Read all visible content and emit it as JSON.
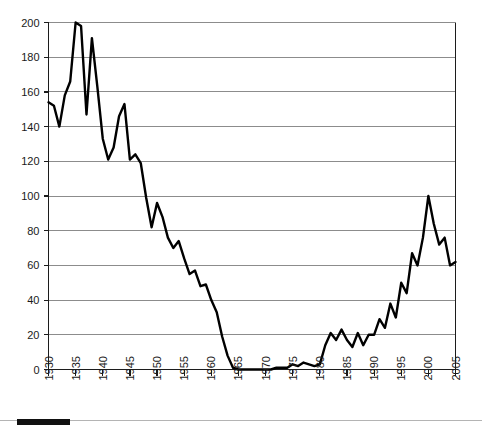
{
  "chart_data": {
    "type": "line",
    "title": "",
    "subtitle": "",
    "xlabel": "",
    "ylabel": "",
    "xlim": [
      1930,
      2005
    ],
    "ylim": [
      0,
      200
    ],
    "grid": true,
    "legend": false,
    "legend_position": "none",
    "line_color": "#000000",
    "grid_color": "#8c8c8c",
    "axis_color": "#1c1c1c",
    "y_ticks": [
      0,
      20,
      40,
      60,
      80,
      100,
      120,
      140,
      160,
      180,
      200
    ],
    "y_tick_labels": [
      "0",
      "20",
      "40",
      "60",
      "80",
      "100",
      "120",
      "140",
      "160",
      "180",
      "200"
    ],
    "x_ticks": [
      1930,
      1935,
      1940,
      1945,
      1950,
      1955,
      1960,
      1965,
      1970,
      1975,
      1980,
      1985,
      1990,
      1995,
      2000,
      2005
    ],
    "x_tick_labels": [
      "1930",
      "1935",
      "1940",
      "1945",
      "1950",
      "1955",
      "1960",
      "1965",
      "1970",
      "1975",
      "1980",
      "1985",
      "1990",
      "1995",
      "2000",
      "2005"
    ],
    "x": [
      1930,
      1931,
      1932,
      1933,
      1934,
      1935,
      1936,
      1937,
      1938,
      1939,
      1940,
      1941,
      1942,
      1943,
      1944,
      1945,
      1946,
      1947,
      1948,
      1949,
      1950,
      1951,
      1952,
      1953,
      1954,
      1955,
      1956,
      1957,
      1958,
      1959,
      1960,
      1961,
      1962,
      1963,
      1964,
      1965,
      1966,
      1967,
      1968,
      1969,
      1970,
      1971,
      1972,
      1973,
      1974,
      1975,
      1976,
      1977,
      1978,
      1979,
      1980,
      1981,
      1982,
      1983,
      1984,
      1985,
      1986,
      1987,
      1988,
      1989,
      1990,
      1991,
      1992,
      1993,
      1994,
      1995,
      1996,
      1997,
      1998,
      1999,
      2000,
      2001,
      2002,
      2003,
      2004,
      2005
    ],
    "values": [
      154,
      152,
      140,
      158,
      166,
      200,
      198,
      147,
      191,
      163,
      133,
      121,
      128,
      146,
      153,
      121,
      124,
      119,
      99,
      82,
      96,
      88,
      76,
      70,
      74,
      64,
      55,
      57,
      48,
      49,
      40,
      33,
      19,
      8,
      1,
      0,
      0,
      0,
      0,
      0,
      0,
      0,
      1,
      1,
      1,
      3,
      2,
      4,
      3,
      2,
      3,
      14,
      21,
      17,
      23,
      17,
      13,
      21,
      14,
      20,
      20,
      29,
      24,
      38,
      30,
      50,
      44,
      67,
      60,
      76,
      100,
      84,
      72,
      76,
      60,
      62
    ],
    "series": [
      {
        "name": "series-1",
        "values": [
          154,
          152,
          140,
          158,
          166,
          200,
          198,
          147,
          191,
          163,
          133,
          121,
          128,
          146,
          153,
          121,
          124,
          119,
          99,
          82,
          96,
          88,
          76,
          70,
          74,
          64,
          55,
          57,
          48,
          49,
          40,
          33,
          19,
          8,
          1,
          0,
          0,
          0,
          0,
          0,
          0,
          0,
          1,
          1,
          1,
          3,
          2,
          4,
          3,
          2,
          3,
          14,
          21,
          17,
          23,
          17,
          13,
          21,
          14,
          20,
          20,
          29,
          24,
          38,
          30,
          50,
          44,
          67,
          60,
          76,
          100,
          84,
          72,
          76,
          60,
          62
        ]
      }
    ],
    "annotations": []
  },
  "footer": {
    "rule_name": "progress-rule"
  }
}
